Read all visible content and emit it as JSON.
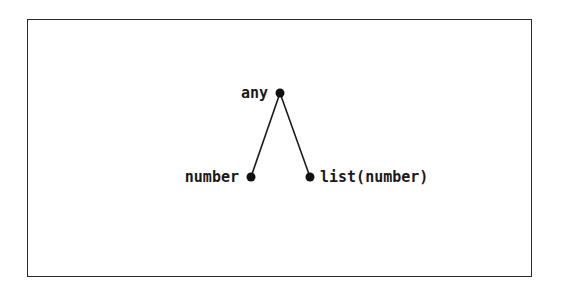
{
  "diagram": {
    "type": "type-hierarchy-tree",
    "nodes": [
      {
        "id": "any",
        "label": "any",
        "x": 280,
        "y": 93,
        "label_side": "left"
      },
      {
        "id": "number",
        "label": "number",
        "x": 251,
        "y": 177,
        "label_side": "left"
      },
      {
        "id": "list_number",
        "label": "list(number)",
        "x": 310,
        "y": 177,
        "label_side": "right"
      }
    ],
    "edges": [
      {
        "from": "any",
        "to": "number"
      },
      {
        "from": "any",
        "to": "list_number"
      }
    ],
    "colors": {
      "line": "#1a1a1a",
      "node": "#111111",
      "border": "#2a2a2a",
      "background": "#ffffff"
    }
  }
}
